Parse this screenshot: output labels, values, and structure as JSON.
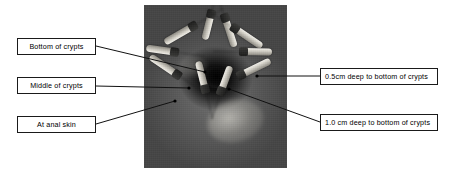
{
  "figure": {
    "type": "annotated-clinical-photograph",
    "background_color": "#ffffff",
    "width": 449,
    "height": 173
  },
  "photo": {
    "name": "anal-canal-photograph",
    "description": "Grayscale intraoperative photograph of the anal canal with radiating clamps and an everted mucosal field around a dark central crypt aperture",
    "x": 144,
    "y": 5,
    "width": 143,
    "height": 163,
    "tones": {
      "darkest": "#050505",
      "mid": "#5a5a5a",
      "light": "#d8d6ce",
      "instrument": "#f2f0ea"
    }
  },
  "callouts": [
    {
      "id": "bottom-of-crypts",
      "label": "Bottom of crypts",
      "side": "left",
      "box": {
        "x": 17,
        "y": 38,
        "width": 79,
        "height": 17
      },
      "leader": {
        "from_x": 96,
        "from_y": 46,
        "to_x": 205,
        "to_y": 72
      }
    },
    {
      "id": "middle-of-crypts",
      "label": "Middle of crypts",
      "side": "left",
      "box": {
        "x": 17,
        "y": 77,
        "width": 79,
        "height": 17
      },
      "leader": {
        "from_x": 96,
        "from_y": 86,
        "to_x": 189,
        "to_y": 88
      }
    },
    {
      "id": "at-anal-skin",
      "label": "At anal skin",
      "side": "left",
      "box": {
        "x": 17,
        "y": 116,
        "width": 79,
        "height": 17
      },
      "leader": {
        "from_x": 96,
        "from_y": 124,
        "to_x": 175,
        "to_y": 101
      }
    },
    {
      "id": "half-cm-deep",
      "label": "0.5cm deep to bottom of crypts",
      "side": "right",
      "box": {
        "x": 320,
        "y": 68,
        "width": 118,
        "height": 17
      },
      "leader": {
        "from_x": 320,
        "from_y": 76,
        "to_x": 257,
        "to_y": 76
      }
    },
    {
      "id": "one-cm-deep",
      "label": "1.0 cm deep to bottom of crypts",
      "side": "right",
      "box": {
        "x": 320,
        "y": 114,
        "width": 118,
        "height": 17
      },
      "leader": {
        "from_x": 320,
        "from_y": 122,
        "to_x": 229,
        "to_y": 89
      }
    }
  ],
  "instruments": [
    {
      "id": "instrument-n",
      "x": 68,
      "y": 2,
      "length": 30,
      "angle": 104
    },
    {
      "id": "instrument-nne",
      "x": 80,
      "y": 6,
      "length": 34,
      "angle": 72
    },
    {
      "id": "instrument-nw",
      "x": 52,
      "y": 16,
      "length": 36,
      "angle": 150
    },
    {
      "id": "instrument-ne",
      "x": 88,
      "y": 18,
      "length": 36,
      "angle": 34
    },
    {
      "id": "instrument-w",
      "x": 34,
      "y": 44,
      "length": 32,
      "angle": 188
    },
    {
      "id": "instrument-e",
      "x": 96,
      "y": 43,
      "length": 32,
      "angle": 1
    },
    {
      "id": "instrument-sw",
      "x": 36,
      "y": 68,
      "length": 36,
      "angle": 214
    },
    {
      "id": "instrument-se",
      "x": 94,
      "y": 68,
      "length": 36,
      "angle": -26
    },
    {
      "id": "instrument-s",
      "x": 62,
      "y": 84,
      "length": 32,
      "angle": 256
    },
    {
      "id": "instrument-sse",
      "x": 76,
      "y": 86,
      "length": 30,
      "angle": -70
    }
  ]
}
